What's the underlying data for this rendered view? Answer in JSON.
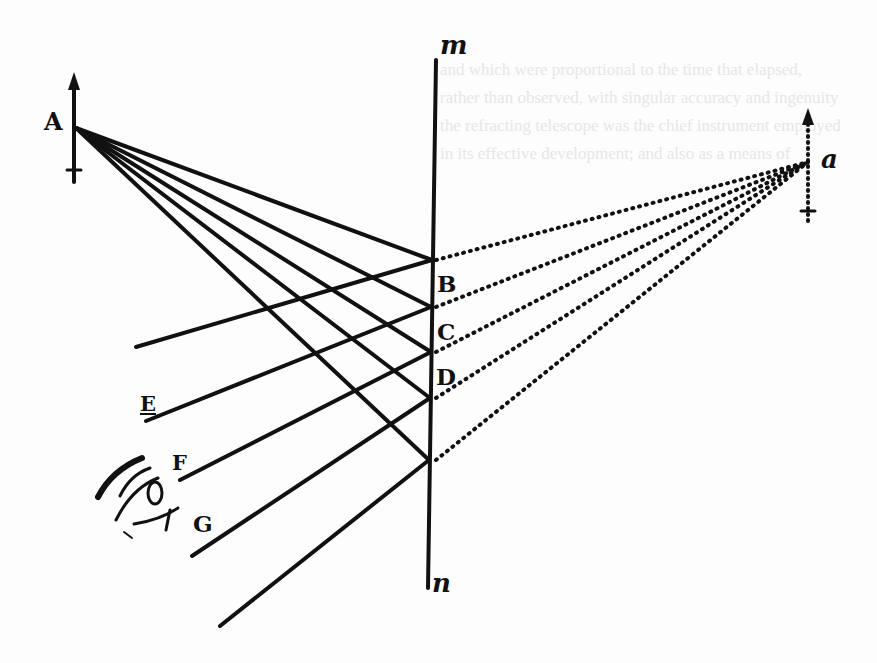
{
  "figure": {
    "mirror": {
      "top_label": "m",
      "bottom_label": "n"
    },
    "object": {
      "label": "A"
    },
    "image": {
      "label": "a"
    },
    "reflection_points": [
      "B",
      "C",
      "D"
    ],
    "eye_rays": [
      "E",
      "F",
      "G"
    ],
    "bleed_through_text": [
      "and which were proportional to the time that elapsed,",
      "rather than observed, with singular accuracy and ingenuity",
      "the refracting telescope was the chief instrument employed",
      "in its effective development; and also as a means of"
    ]
  },
  "colors": {
    "ink": "#111111",
    "paper": "#fdfdfd"
  }
}
